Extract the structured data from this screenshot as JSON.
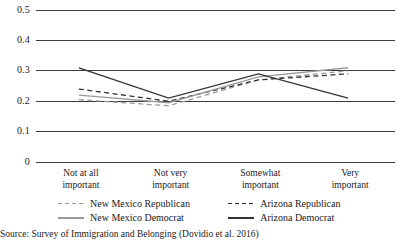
{
  "chart_data": {
    "type": "line",
    "title": "",
    "subtitle": "",
    "xlabel": "",
    "ylabel": "",
    "categories": [
      "Not at all important",
      "Not very important",
      "Somewhat important",
      "Very important"
    ],
    "category_lines": [
      [
        "Not at all",
        "important"
      ],
      [
        "Not very",
        "important"
      ],
      [
        "Somewhat",
        "important"
      ],
      [
        "Very",
        "important"
      ]
    ],
    "ylim": [
      0,
      0.5
    ],
    "yticks": [
      0,
      0.1,
      0.2,
      0.3,
      0.4,
      0.5
    ],
    "ytick_labels": [
      "0",
      "0.1",
      "0.2",
      "0.3",
      "0.4",
      "0.5"
    ],
    "grid": true,
    "grid_axis": "y",
    "legend_position": "below-axis",
    "series": [
      {
        "name": "New Mexico Republican",
        "values": [
          0.205,
          0.185,
          0.27,
          0.3
        ],
        "style": "dashed",
        "color": "#9a9a9a"
      },
      {
        "name": "Arizona Republican",
        "values": [
          0.24,
          0.2,
          0.27,
          0.29
        ],
        "style": "dashed",
        "color": "#333333"
      },
      {
        "name": "New Mexico Democrat",
        "values": [
          0.22,
          0.195,
          0.28,
          0.31
        ],
        "style": "solid",
        "color": "#9a9a9a"
      },
      {
        "name": "Arizona Democrat",
        "values": [
          0.31,
          0.21,
          0.29,
          0.21
        ],
        "style": "solid",
        "color": "#333333"
      }
    ]
  },
  "legend": {
    "items": [
      {
        "label": "New Mexico Republican",
        "style": "dashed",
        "color": "#9a9a9a"
      },
      {
        "label": "Arizona Republican",
        "style": "dashed",
        "color": "#333333"
      },
      {
        "label": "New Mexico Democrat",
        "style": "solid",
        "color": "#9a9a9a"
      },
      {
        "label": "Arizona Democrat",
        "style": "solid",
        "color": "#333333"
      }
    ]
  },
  "source": {
    "text": "Source: Survey of Immigration and Belonging (Dovidio et al. 2016)"
  },
  "colors": {
    "dark": "#333333",
    "light": "#9a9a9a",
    "grid": "#3a3a3a",
    "text": "#1a1a1a"
  }
}
